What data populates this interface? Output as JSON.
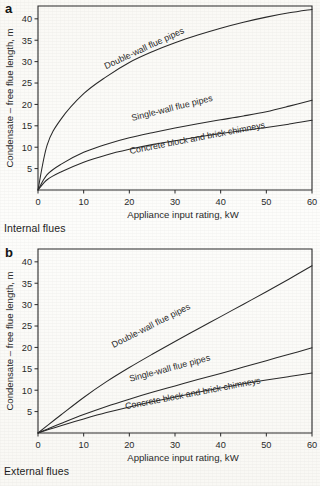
{
  "figure": {
    "background_color": "#fbfaf7",
    "ink_color": "#2a2a2a"
  },
  "panels": [
    {
      "letter": "a",
      "caption": "Internal flues"
    },
    {
      "letter": "b",
      "caption": "External flues"
    }
  ],
  "chart_data": [
    {
      "type": "line",
      "panel": "a",
      "title": "Internal flues",
      "xlabel": "Appliance input rating, kW",
      "ylabel": "Condensate – free flue length, m",
      "xlim": [
        0,
        60
      ],
      "ylim": [
        0,
        43
      ],
      "xticks": [
        0,
        10,
        20,
        30,
        40,
        50,
        60
      ],
      "yticks": [
        5,
        10,
        15,
        20,
        25,
        30,
        35,
        40
      ],
      "xtick_labels": [
        "0",
        "10",
        "20",
        "30",
        "40",
        "50",
        "60"
      ],
      "ytick_labels": [
        "5",
        "10",
        "15",
        "20",
        "25",
        "30",
        "35",
        "40"
      ],
      "grid": false,
      "legend": "inline-curve-labels",
      "x": [
        0,
        2,
        5,
        10,
        15,
        20,
        25,
        30,
        35,
        40,
        45,
        50,
        55,
        60
      ],
      "series": [
        {
          "name": "Double-wall flue pipes",
          "values": [
            0,
            10.5,
            16.5,
            22.5,
            26.5,
            29.8,
            32.3,
            34.4,
            36.2,
            37.8,
            39.2,
            40.4,
            41.4,
            42.2
          ]
        },
        {
          "name": "Single-wall flue pipes",
          "values": [
            0,
            3.6,
            6.0,
            8.8,
            10.7,
            12.2,
            13.4,
            14.5,
            15.5,
            16.4,
            17.3,
            18.3,
            19.6,
            21.0
          ]
        },
        {
          "name": "Concrete block and brick chimneys",
          "values": [
            0,
            2.4,
            4.2,
            6.5,
            8.2,
            9.5,
            10.6,
            11.5,
            12.4,
            13.2,
            13.9,
            14.6,
            15.4,
            16.3
          ]
        }
      ]
    },
    {
      "type": "line",
      "panel": "b",
      "title": "External flues",
      "xlabel": "Appliance input rating, kW",
      "ylabel": "Condensate – free flue length, m",
      "xlim": [
        0,
        60
      ],
      "ylim": [
        0,
        43
      ],
      "xticks": [
        0,
        10,
        20,
        30,
        40,
        50,
        60
      ],
      "yticks": [
        5,
        10,
        15,
        20,
        25,
        30,
        35,
        40
      ],
      "xtick_labels": [
        "0",
        "10",
        "20",
        "30",
        "40",
        "50",
        "60"
      ],
      "ytick_labels": [
        "5",
        "10",
        "15",
        "20",
        "25",
        "30",
        "35",
        "40"
      ],
      "grid": false,
      "legend": "inline-curve-labels",
      "x": [
        0,
        2,
        5,
        10,
        15,
        20,
        25,
        30,
        35,
        40,
        45,
        50,
        55,
        60
      ],
      "series": [
        {
          "name": "Double-wall flue pipes",
          "values": [
            0,
            1.7,
            4.2,
            8.3,
            12.0,
            15.3,
            18.4,
            21.4,
            24.3,
            27.2,
            30.1,
            33.0,
            36.0,
            39.1
          ]
        },
        {
          "name": "Single-wall flue pipes",
          "values": [
            0,
            0.9,
            2.2,
            4.3,
            6.2,
            7.9,
            9.5,
            11.0,
            12.5,
            13.9,
            15.4,
            16.9,
            18.4,
            19.9
          ]
        },
        {
          "name": "Concrete block and brick chimneys",
          "values": [
            0,
            0.7,
            1.7,
            3.3,
            4.8,
            6.1,
            7.3,
            8.4,
            9.5,
            10.5,
            11.5,
            12.4,
            13.2,
            14.0
          ]
        }
      ]
    }
  ]
}
